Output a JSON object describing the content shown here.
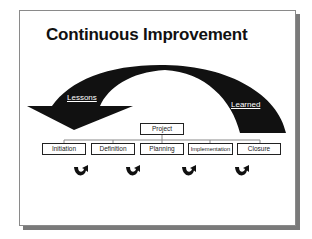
{
  "slide": {
    "title": "Continuous Improvement",
    "arrow_labels": {
      "left": "Lessons",
      "right": "Learned"
    },
    "root_box": "Project",
    "phases": [
      "Initiation",
      "Definition",
      "Planning",
      "Implementation",
      "Closure"
    ],
    "cycle_icon": "u-turn-arrow-icon",
    "colors": {
      "arrow": "#111111",
      "box_border": "#222222",
      "background": "#ffffff",
      "shadow": "#7a7a7a"
    }
  }
}
